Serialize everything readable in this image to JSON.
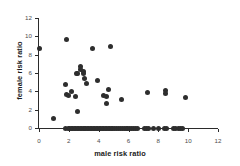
{
  "chart_data": {
    "type": "scatter",
    "title": "",
    "xlabel": "male risk ratio",
    "ylabel": "female risk ratio",
    "xlim": [
      0,
      12
    ],
    "ylim": [
      0,
      12
    ],
    "xticks": [
      0,
      2,
      4,
      6,
      8,
      10,
      12
    ],
    "yticks": [
      0,
      2,
      4,
      6,
      8,
      10,
      12
    ],
    "xtick_labels": [
      "0",
      "2",
      "4",
      "6",
      "8",
      "10",
      "12"
    ],
    "ytick_labels": [
      "0",
      "2",
      "4",
      "6",
      "8",
      "10",
      "12"
    ],
    "grid": false,
    "legend": null,
    "marker_color": "#2e2e2e",
    "axis_color": "#2b2b2b",
    "tick_label_color": "#4d4d4d",
    "points": [
      [
        0.0,
        8.65
      ],
      [
        1.0,
        1.05
      ],
      [
        1.82,
        9.7
      ],
      [
        1.8,
        4.8
      ],
      [
        1.85,
        3.65
      ],
      [
        1.95,
        3.5
      ],
      [
        2.2,
        3.95
      ],
      [
        2.45,
        3.4
      ],
      [
        2.5,
        6.0
      ],
      [
        2.6,
        5.95
      ],
      [
        2.55,
        1.75
      ],
      [
        2.75,
        6.75
      ],
      [
        2.8,
        6.35
      ],
      [
        2.95,
        6.15
      ],
      [
        3.0,
        5.95
      ],
      [
        3.05,
        5.35
      ],
      [
        3.2,
        4.85
      ],
      [
        3.6,
        8.65
      ],
      [
        3.9,
        5.2
      ],
      [
        4.35,
        3.6
      ],
      [
        4.5,
        3.45
      ],
      [
        4.55,
        2.65
      ],
      [
        4.65,
        4.15
      ],
      [
        4.8,
        8.85
      ],
      [
        5.5,
        3.15
      ],
      [
        7.3,
        3.9
      ],
      [
        8.45,
        4.1
      ],
      [
        8.45,
        3.75
      ],
      [
        9.85,
        3.3
      ],
      [
        1.8,
        0.0
      ],
      [
        1.95,
        0.0
      ],
      [
        2.05,
        0.0
      ],
      [
        2.15,
        0.0
      ],
      [
        2.25,
        0.0
      ],
      [
        2.35,
        0.0
      ],
      [
        2.45,
        0.0
      ],
      [
        2.55,
        0.0
      ],
      [
        2.65,
        0.0
      ],
      [
        2.75,
        0.0
      ],
      [
        2.85,
        0.0
      ],
      [
        2.95,
        0.0
      ],
      [
        3.05,
        0.0
      ],
      [
        3.15,
        0.0
      ],
      [
        3.25,
        0.0
      ],
      [
        3.35,
        0.0
      ],
      [
        3.45,
        0.0
      ],
      [
        3.55,
        0.0
      ],
      [
        3.65,
        0.0
      ],
      [
        3.75,
        0.0
      ],
      [
        3.85,
        0.0
      ],
      [
        3.95,
        0.0
      ],
      [
        4.05,
        0.0
      ],
      [
        4.15,
        0.0
      ],
      [
        4.25,
        0.0
      ],
      [
        4.35,
        0.0
      ],
      [
        4.45,
        0.0
      ],
      [
        4.55,
        0.0
      ],
      [
        4.65,
        0.0
      ],
      [
        4.75,
        0.0
      ],
      [
        4.85,
        0.0
      ],
      [
        4.95,
        0.0
      ],
      [
        5.05,
        0.0
      ],
      [
        5.2,
        0.0
      ],
      [
        5.3,
        0.0
      ],
      [
        5.45,
        0.0
      ],
      [
        5.6,
        0.0
      ],
      [
        5.75,
        0.0
      ],
      [
        5.85,
        0.0
      ],
      [
        5.95,
        0.0
      ],
      [
        6.1,
        0.0
      ],
      [
        6.2,
        0.0
      ],
      [
        6.35,
        0.0
      ],
      [
        6.5,
        0.0
      ],
      [
        6.6,
        0.0
      ],
      [
        7.05,
        0.0
      ],
      [
        7.2,
        0.0
      ],
      [
        7.35,
        0.0
      ],
      [
        7.7,
        0.0
      ],
      [
        8.0,
        0.0
      ],
      [
        8.4,
        0.0
      ],
      [
        8.55,
        0.0
      ],
      [
        9.0,
        0.0
      ],
      [
        9.15,
        0.0
      ],
      [
        9.35,
        0.0
      ],
      [
        9.5,
        0.0
      ],
      [
        9.65,
        0.0
      ]
    ]
  }
}
